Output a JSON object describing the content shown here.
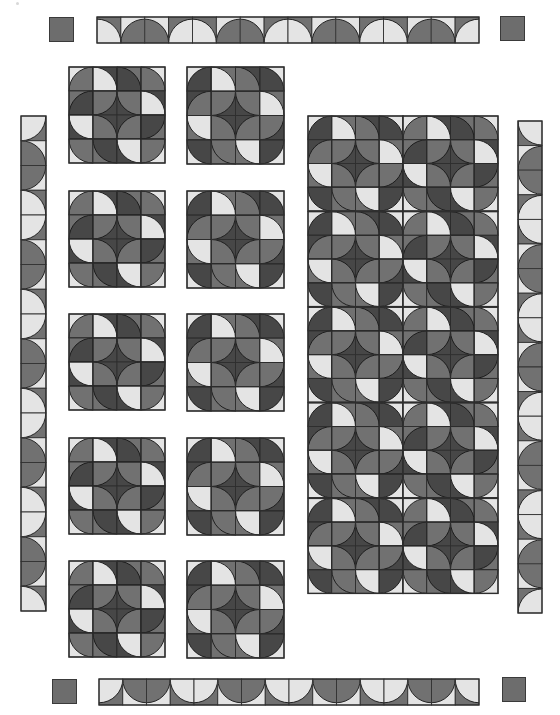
{
  "colors": {
    "light": "#e4e4e4",
    "medium": "#717171",
    "dark": "#474747",
    "outline": "#2e2e2e",
    "corner_square": "#6d6d6d"
  },
  "block_variants": {
    "A": [
      [
        [
          "light",
          "BR",
          "medium"
        ],
        [
          "dark",
          "BL",
          "light"
        ],
        [
          "medium",
          "BL",
          "dark"
        ],
        [
          "light",
          "BL",
          "medium"
        ]
      ],
      [
        [
          "medium",
          "BR",
          "dark"
        ],
        [
          "dark",
          "TL",
          "medium"
        ],
        [
          "dark",
          "TR",
          "medium"
        ],
        [
          "dark",
          "BL",
          "light"
        ]
      ],
      [
        [
          "dark",
          "TR",
          "light"
        ],
        [
          "dark",
          "BL",
          "medium"
        ],
        [
          "dark",
          "BR",
          "medium"
        ],
        [
          "medium",
          "TL",
          "dark"
        ]
      ],
      [
        [
          "light",
          "TR",
          "medium"
        ],
        [
          "medium",
          "TR",
          "dark"
        ],
        [
          "dark",
          "TR",
          "light"
        ],
        [
          "light",
          "TL",
          "medium"
        ]
      ]
    ],
    "B": [
      [
        [
          "light",
          "BR",
          "dark"
        ],
        [
          "medium",
          "BL",
          "light"
        ],
        [
          "dark",
          "BL",
          "medium"
        ],
        [
          "light",
          "BL",
          "dark"
        ]
      ],
      [
        [
          "dark",
          "BR",
          "medium"
        ],
        [
          "dark",
          "TL",
          "medium"
        ],
        [
          "dark",
          "TR",
          "medium"
        ],
        [
          "medium",
          "BL",
          "light"
        ]
      ],
      [
        [
          "medium",
          "TR",
          "light"
        ],
        [
          "dark",
          "BL",
          "medium"
        ],
        [
          "dark",
          "BR",
          "medium"
        ],
        [
          "dark",
          "TL",
          "medium"
        ]
      ],
      [
        [
          "light",
          "TR",
          "dark"
        ],
        [
          "medium",
          "TR",
          "medium"
        ],
        [
          "medium",
          "TR",
          "light"
        ],
        [
          "light",
          "TL",
          "dark"
        ]
      ]
    ]
  },
  "blocks": [
    {
      "name": "block-a1",
      "variant": "A",
      "x": 68,
      "y": 66,
      "size": 96
    },
    {
      "name": "block-b1",
      "variant": "B",
      "x": 186,
      "y": 66,
      "size": 97
    },
    {
      "name": "block-a2",
      "variant": "A",
      "x": 68,
      "y": 190,
      "size": 96
    },
    {
      "name": "block-b2",
      "variant": "B",
      "x": 186,
      "y": 190,
      "size": 97
    },
    {
      "name": "block-a3",
      "variant": "A",
      "x": 68,
      "y": 313,
      "size": 96
    },
    {
      "name": "block-b3",
      "variant": "B",
      "x": 186,
      "y": 313,
      "size": 97
    },
    {
      "name": "block-a4",
      "variant": "A",
      "x": 68,
      "y": 437,
      "size": 96
    },
    {
      "name": "block-b4",
      "variant": "B",
      "x": 186,
      "y": 437,
      "size": 97
    },
    {
      "name": "block-a5",
      "variant": "A",
      "x": 68,
      "y": 560,
      "size": 96
    },
    {
      "name": "block-b5",
      "variant": "B",
      "x": 186,
      "y": 560,
      "size": 97
    }
  ],
  "large_panel": {
    "x": 307,
    "y": 115,
    "cols": 2,
    "rows": 5,
    "block_size": 95,
    "variants": [
      "B",
      "A"
    ]
  },
  "borders": {
    "top": {
      "x": 96,
      "y": 16,
      "length": 382,
      "thickness": 26,
      "cells": 16,
      "orientation": "horizontal",
      "arc_side": "bottom"
    },
    "bottom": {
      "x": 98,
      "y": 678,
      "length": 380,
      "thickness": 26,
      "cells": 16,
      "orientation": "horizontal",
      "arc_side": "top"
    },
    "left": {
      "x": 20,
      "y": 115,
      "length": 495,
      "thickness": 25,
      "cells": 20,
      "orientation": "vertical",
      "arc_side": "left"
    },
    "right": {
      "x": 517,
      "y": 120,
      "length": 492,
      "thickness": 24,
      "cells": 20,
      "orientation": "vertical",
      "arc_side": "right"
    }
  },
  "border_pattern": [
    "light-a",
    "medium-1",
    "medium-2",
    "light-b"
  ],
  "corner_squares": [
    {
      "name": "corner-square-top-left",
      "x": 49,
      "y": 17,
      "w": 25,
      "h": 25
    },
    {
      "name": "corner-square-top-right",
      "x": 500,
      "y": 16,
      "w": 25,
      "h": 25
    },
    {
      "name": "corner-square-bottom-left",
      "x": 52,
      "y": 679,
      "w": 25,
      "h": 25
    },
    {
      "name": "corner-square-bottom-right",
      "x": 502,
      "y": 677,
      "w": 24,
      "h": 25
    }
  ]
}
